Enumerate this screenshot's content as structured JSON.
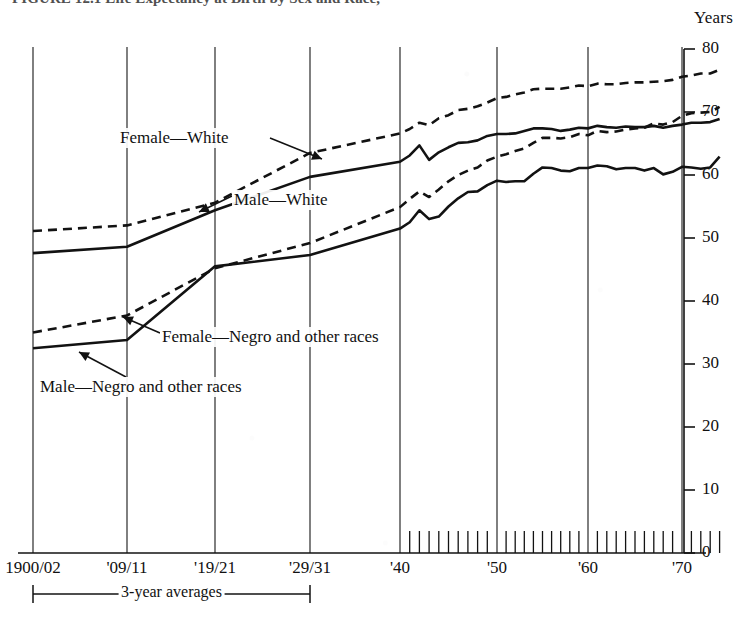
{
  "figure": {
    "title": "FIGURE 12.1   Life Expectancy at Birth by Sex and Race,",
    "axis_unit_label": "Years"
  },
  "axes": {
    "y_axis": {
      "label": "Years",
      "min": 0,
      "max": 80,
      "tick_step": 10,
      "ticks": [
        "0",
        "10",
        "20",
        "30",
        "40",
        "50",
        "60",
        "70",
        "80"
      ]
    },
    "x_axis": {
      "tick_labels": [
        "1900/02",
        "'09/11",
        "'19/21",
        "'29/31",
        "'40",
        "'50",
        "'60",
        "'70"
      ],
      "bracket_caption": "3-year averages",
      "annual_ticks_start_label": "'40",
      "annual_ticks_end_label": "'74"
    }
  },
  "series_labels": {
    "female_white": "Female—White",
    "male_white": "Male—White",
    "female_negro": "Female—Negro and other races",
    "male_negro": "Male—Negro and other races"
  },
  "style": {
    "line_color": "#121212",
    "grid_color": "#2a2a2a",
    "background": "#ffffff"
  },
  "chart_data": {
    "type": "line",
    "title": "FIGURE 12.1   Life Expectancy at Birth by Sex and Race,",
    "xlabel": "",
    "ylabel": "Years",
    "ylim": [
      0,
      80
    ],
    "grid": "vertical",
    "legend": "inline-annotations",
    "x_category_labels": [
      "1900/02",
      "'09/11",
      "'19/21",
      "'29/31",
      "'40",
      "'50",
      "'60",
      "'70"
    ],
    "x_category_years": [
      1901,
      1910,
      1920,
      1930,
      1940,
      1950,
      1960,
      1970
    ],
    "series": [
      {
        "name": "Female—White",
        "style": "dashed",
        "x": [
          1901,
          1910,
          1920,
          1930,
          1940,
          1941,
          1942,
          1943,
          1944,
          1945,
          1946,
          1947,
          1948,
          1949,
          1950,
          1951,
          1952,
          1953,
          1954,
          1955,
          1956,
          1957,
          1958,
          1959,
          1960,
          1961,
          1962,
          1963,
          1964,
          1965,
          1966,
          1967,
          1968,
          1969,
          1970,
          1971,
          1972,
          1973,
          1974
        ],
        "values": [
          51.1,
          52.0,
          55.6,
          63.5,
          66.6,
          67.3,
          68.3,
          67.9,
          69.0,
          69.5,
          70.3,
          70.5,
          70.9,
          71.5,
          72.2,
          72.4,
          72.8,
          73.1,
          73.6,
          73.7,
          73.7,
          73.7,
          73.9,
          74.2,
          74.1,
          74.5,
          74.4,
          74.4,
          74.6,
          74.7,
          74.7,
          74.8,
          74.9,
          75.1,
          75.6,
          75.8,
          76.1,
          76.1,
          76.7
        ],
        "endpoint_label": "Female—White"
      },
      {
        "name": "Male—White",
        "style": "solid",
        "x": [
          1901,
          1910,
          1920,
          1930,
          1940,
          1941,
          1942,
          1943,
          1944,
          1945,
          1946,
          1947,
          1948,
          1949,
          1950,
          1951,
          1952,
          1953,
          1954,
          1955,
          1956,
          1957,
          1958,
          1959,
          1960,
          1961,
          1962,
          1963,
          1964,
          1965,
          1966,
          1967,
          1968,
          1969,
          1970,
          1971,
          1972,
          1973,
          1974
        ],
        "values": [
          47.6,
          48.6,
          54.4,
          59.7,
          62.1,
          63.1,
          64.7,
          62.4,
          63.6,
          64.4,
          65.1,
          65.2,
          65.5,
          66.2,
          66.5,
          66.5,
          66.6,
          67.0,
          67.4,
          67.4,
          67.3,
          67.0,
          67.2,
          67.5,
          67.4,
          67.8,
          67.6,
          67.5,
          67.7,
          67.6,
          67.6,
          67.8,
          67.5,
          67.8,
          68.0,
          68.3,
          68.3,
          68.4,
          68.9
        ],
        "endpoint_label": "Male—White"
      },
      {
        "name": "Female—Negro and other races",
        "style": "dashed",
        "x": [
          1901,
          1910,
          1920,
          1930,
          1940,
          1941,
          1942,
          1943,
          1944,
          1945,
          1946,
          1947,
          1948,
          1949,
          1950,
          1951,
          1952,
          1953,
          1954,
          1955,
          1956,
          1957,
          1958,
          1959,
          1960,
          1961,
          1962,
          1963,
          1964,
          1965,
          1966,
          1967,
          1968,
          1969,
          1970,
          1971,
          1972,
          1973,
          1974
        ],
        "values": [
          35.0,
          37.7,
          45.2,
          49.2,
          54.9,
          56.2,
          57.4,
          56.5,
          57.7,
          59.0,
          60.0,
          60.7,
          61.2,
          62.3,
          62.9,
          63.3,
          63.8,
          64.2,
          65.1,
          65.9,
          65.9,
          65.8,
          66.0,
          66.5,
          66.3,
          67.0,
          66.8,
          66.9,
          67.2,
          67.4,
          67.5,
          68.2,
          68.0,
          68.4,
          69.4,
          69.8,
          69.9,
          70.0,
          70.8
        ],
        "endpoint_label": "Female—Negro and other races"
      },
      {
        "name": "Male—Negro and other races",
        "style": "solid",
        "x": [
          1901,
          1910,
          1920,
          1930,
          1940,
          1941,
          1942,
          1943,
          1944,
          1945,
          1946,
          1947,
          1948,
          1949,
          1950,
          1951,
          1952,
          1953,
          1954,
          1955,
          1956,
          1957,
          1958,
          1959,
          1960,
          1961,
          1962,
          1963,
          1964,
          1965,
          1966,
          1967,
          1968,
          1969,
          1970,
          1971,
          1972,
          1973,
          1974
        ],
        "values": [
          32.5,
          33.8,
          45.5,
          47.3,
          51.5,
          52.5,
          54.4,
          53.0,
          53.4,
          55.0,
          56.3,
          57.3,
          57.4,
          58.4,
          59.1,
          58.9,
          59.0,
          59.0,
          60.2,
          61.2,
          61.1,
          60.7,
          60.6,
          61.1,
          61.1,
          61.5,
          61.4,
          60.9,
          61.1,
          61.1,
          60.7,
          61.1,
          60.1,
          60.5,
          61.3,
          61.2,
          61.0,
          61.2,
          62.9
        ],
        "endpoint_label": "Male—Negro and other races"
      }
    ]
  }
}
